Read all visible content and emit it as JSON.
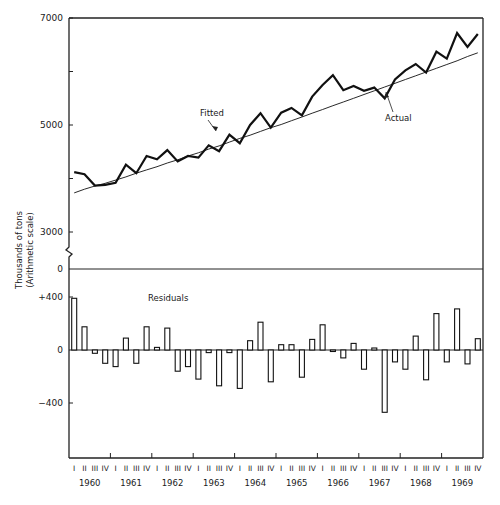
{
  "chart_data": [
    {
      "type": "line",
      "title": "",
      "panel": "upper",
      "xlabel": "",
      "ylabel": "Thousands of tons (Arithmetic scale)",
      "ylabel_lines": [
        "Thousands of tons",
        "(Arithmetic scale)"
      ],
      "ylim": [
        3000,
        7000
      ],
      "y_ticks": [
        3000,
        4000,
        5000,
        6000,
        7000
      ],
      "y_tick_labels": [
        "3000",
        "",
        "5000",
        "",
        "7000"
      ],
      "axis_break": true,
      "break_zero_label": "0",
      "grid": false,
      "x_years": [
        "1960",
        "1961",
        "1962",
        "1963",
        "1964",
        "1965",
        "1966",
        "1967",
        "1968",
        "1969"
      ],
      "x_quarters": [
        "I",
        "II",
        "III",
        "IV"
      ],
      "series": [
        {
          "name": "Actual",
          "style": "thick",
          "values": [
            4120,
            4080,
            3870,
            3880,
            3920,
            4260,
            4100,
            4420,
            4360,
            4530,
            4320,
            4420,
            4390,
            4620,
            4510,
            4820,
            4660,
            5000,
            5220,
            4950,
            5230,
            5320,
            5180,
            5530,
            5750,
            5930,
            5650,
            5730,
            5640,
            5700,
            5500,
            5850,
            6020,
            6140,
            5980,
            6370,
            6240,
            6720,
            6460,
            6700
          ]
        },
        {
          "name": "Fitted",
          "style": "thin",
          "values": [
            3730,
            3800,
            3860,
            3910,
            3970,
            4030,
            4100,
            4160,
            4220,
            4290,
            4350,
            4420,
            4480,
            4550,
            4610,
            4680,
            4750,
            4810,
            4880,
            4950,
            5010,
            5080,
            5150,
            5220,
            5290,
            5360,
            5430,
            5500,
            5570,
            5640,
            5710,
            5780,
            5850,
            5920,
            5990,
            6060,
            6130,
            6200,
            6280,
            6350
          ]
        }
      ],
      "annotations": [
        {
          "text": "Fitted",
          "points_to": "Fitted"
        },
        {
          "text": "Actual",
          "points_to": "Actual"
        }
      ]
    },
    {
      "type": "bar",
      "title": "Residuals",
      "panel": "lower",
      "xlabel": "",
      "ylabel": "",
      "ylim": [
        -800,
        400
      ],
      "y_ticks": [
        400,
        0,
        -400
      ],
      "y_tick_labels": [
        "+400",
        "0",
        "−400"
      ],
      "grid": false,
      "categories_years": [
        "1960",
        "1961",
        "1962",
        "1963",
        "1964",
        "1965",
        "1966",
        "1967",
        "1968",
        "1969"
      ],
      "categories_quarters": [
        "I",
        "II",
        "III",
        "IV"
      ],
      "values": [
        390,
        175,
        -25,
        -100,
        -125,
        90,
        -100,
        175,
        20,
        165,
        -160,
        -125,
        -220,
        -20,
        -270,
        -20,
        -290,
        70,
        210,
        -240,
        40,
        40,
        -205,
        80,
        190,
        -10,
        -60,
        50,
        -145,
        15,
        -470,
        -90,
        -145,
        105,
        -225,
        275,
        -90,
        310,
        -105,
        85
      ]
    }
  ],
  "labels": {
    "y_axis_line1": "Thousands of tons",
    "y_axis_line2": "(Arithmetic scale)",
    "fitted": "Fitted",
    "actual": "Actual",
    "residuals": "Residuals",
    "y7000": "7000",
    "y5000": "5000",
    "y3000": "3000",
    "y0": "0",
    "yplus400": "+400",
    "yres0": "0",
    "yminus400": "−400"
  }
}
